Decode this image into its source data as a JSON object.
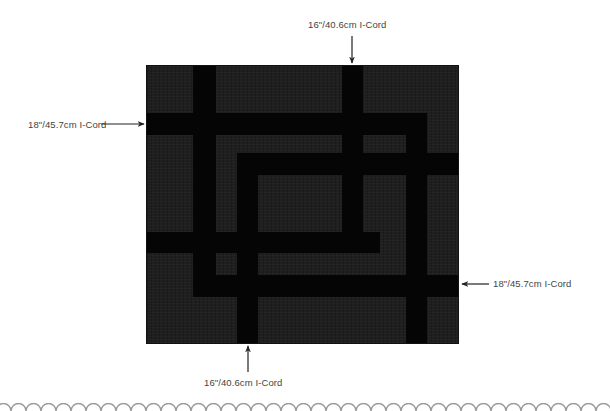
{
  "diagram": {
    "labels": {
      "top": "16\"/40.6cm I-Cord",
      "left": "18\"/45.7cm I-Cord",
      "right": "18\"/45.7cm I-Cord",
      "bottom": "16\"/40.6cm I-Cord"
    },
    "colors": {
      "background": "#ffffff",
      "blanket": "#1f1f1f",
      "cord": "#050505",
      "label_text": "#444444",
      "arrow": "#222222",
      "scallop_border": "#9a9a9a"
    },
    "cords": [
      {
        "id": "v-left-long",
        "orientation": "vertical"
      },
      {
        "id": "h-top",
        "orientation": "horizontal"
      },
      {
        "id": "v-top",
        "orientation": "vertical"
      },
      {
        "id": "v-right",
        "orientation": "vertical"
      },
      {
        "id": "h-inner",
        "orientation": "horizontal"
      },
      {
        "id": "v-inner",
        "orientation": "vertical"
      },
      {
        "id": "h-middle",
        "orientation": "horizontal"
      },
      {
        "id": "h-lower",
        "orientation": "horizontal"
      }
    ]
  }
}
